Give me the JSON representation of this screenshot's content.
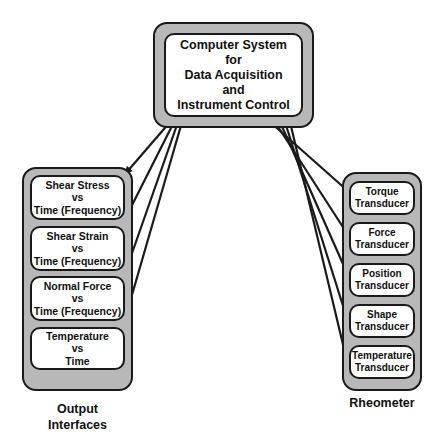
{
  "central": {
    "lines": [
      "Computer System",
      "for",
      "Data Acquisition",
      "and",
      "Instrument Control"
    ]
  },
  "output_interfaces": {
    "caption": [
      "Output",
      "Interfaces"
    ],
    "items": [
      {
        "lines": [
          "Shear Stress",
          "vs",
          "Time (Frequency)"
        ]
      },
      {
        "lines": [
          "Shear Strain",
          "vs",
          "Time (Frequency)"
        ]
      },
      {
        "lines": [
          "Normal Force",
          "vs",
          "Time (Frequency)"
        ]
      },
      {
        "lines": [
          "Temperature",
          "vs",
          "Time"
        ]
      }
    ]
  },
  "rheometer": {
    "caption": [
      "Rheometer"
    ],
    "items": [
      {
        "lines": [
          "Torque",
          "Transducer"
        ]
      },
      {
        "lines": [
          "Force",
          "Transducer"
        ]
      },
      {
        "lines": [
          "Position",
          "Transducer"
        ]
      },
      {
        "lines": [
          "Shape",
          "Transducer"
        ]
      },
      {
        "lines": [
          "Temperature",
          "Transducer"
        ]
      }
    ]
  },
  "colors": {
    "panel_fill": "#b8b8b8",
    "box_fill": "#ffffff",
    "stroke": "#1a1a1a"
  }
}
